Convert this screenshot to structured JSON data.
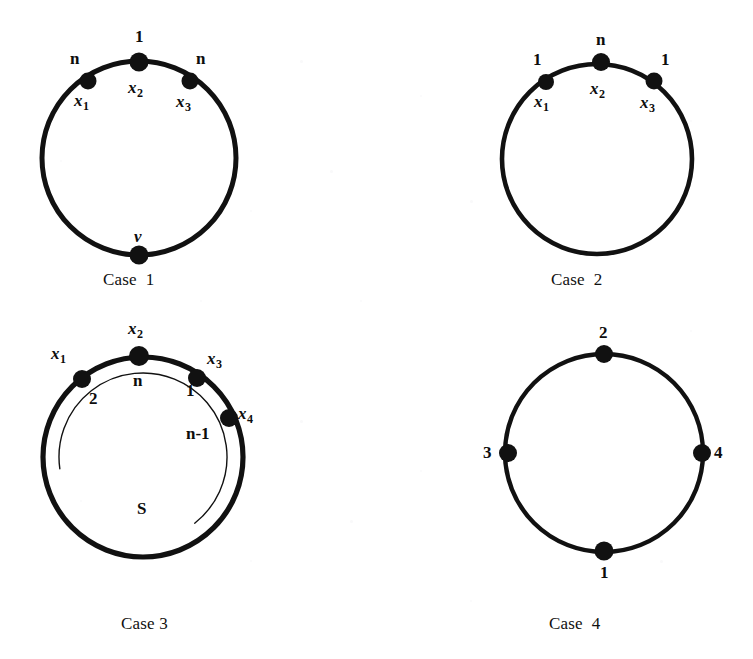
{
  "figure": {
    "background_color": "#ffffff",
    "ink_color": "#111111",
    "panels": [
      {
        "id": "case-1",
        "caption": "Case  1",
        "caption_pos": {
          "x": 103,
          "y": 270
        },
        "circle": {
          "cx": 139,
          "cy": 158,
          "r": 97,
          "stroke_width": 5.0
        },
        "inner_arc": null,
        "vertices": [
          {
            "name": "x1",
            "cx": 88,
            "cy": 81,
            "r": 8.5,
            "var_label": {
              "text": "x",
              "sub": "1",
              "x": 74,
              "y": 92
            },
            "edge_label": {
              "text": "n",
              "x": 70,
              "y": 50,
              "style": "plain"
            }
          },
          {
            "name": "x2",
            "cx": 139,
            "cy": 62,
            "r": 9.5,
            "var_label": {
              "text": "x",
              "sub": "2",
              "x": 128,
              "y": 79
            },
            "edge_label": {
              "text": "1",
              "x": 135,
              "y": 28,
              "style": "plain"
            }
          },
          {
            "name": "x3",
            "cx": 190,
            "cy": 81,
            "r": 8.5,
            "var_label": {
              "text": "x",
              "sub": "3",
              "x": 176,
              "y": 93
            },
            "edge_label": {
              "text": "n",
              "x": 196,
              "y": 50,
              "style": "plain"
            }
          },
          {
            "name": "v",
            "cx": 139,
            "cy": 255,
            "r": 9.5,
            "var_label": null,
            "edge_label": {
              "text": "v",
              "x": 134,
              "y": 228,
              "style": "italic"
            }
          }
        ]
      },
      {
        "id": "case-2",
        "caption": "Case  2",
        "caption_pos": {
          "x": 551,
          "y": 270
        },
        "circle": {
          "cx": 597,
          "cy": 159,
          "r": 95,
          "stroke_width": 4.6
        },
        "inner_arc": null,
        "vertices": [
          {
            "name": "x1",
            "cx": 546,
            "cy": 82,
            "r": 8.0,
            "var_label": {
              "text": "x",
              "sub": "1",
              "x": 534,
              "y": 93
            },
            "edge_label": {
              "text": "1",
              "x": 533,
              "y": 51,
              "style": "plain"
            }
          },
          {
            "name": "x2",
            "cx": 601,
            "cy": 62,
            "r": 9.0,
            "var_label": {
              "text": "x",
              "sub": "2",
              "x": 590,
              "y": 80
            },
            "edge_label": {
              "text": "n",
              "x": 596,
              "y": 31,
              "style": "plain"
            }
          },
          {
            "name": "x3",
            "cx": 654,
            "cy": 81,
            "r": 8.5,
            "var_label": {
              "text": "x",
              "sub": "3",
              "x": 640,
              "y": 94
            },
            "edge_label": {
              "text": "1",
              "x": 661,
              "y": 51,
              "style": "plain"
            }
          }
        ]
      },
      {
        "id": "case-3",
        "caption": "Case 3",
        "caption_pos": {
          "x": 121,
          "y": 614
        },
        "circle": {
          "cx": 143,
          "cy": 457,
          "r": 100,
          "stroke_width": 5.2
        },
        "inner_arc": {
          "label": "S",
          "label_pos": {
            "x": 137,
            "y": 500
          },
          "stroke_width": 1.4,
          "radius": 84,
          "start_angle_deg": 172,
          "end_angle_deg": 412
        },
        "vertices": [
          {
            "name": "x1",
            "cx": 82,
            "cy": 379,
            "r": 9.0,
            "var_label": {
              "text": "x",
              "sub": "1",
              "x": 51,
              "y": 345
            },
            "edge_label": {
              "text": "2",
              "x": 89,
              "y": 390,
              "style": "plain"
            }
          },
          {
            "name": "x2",
            "cx": 139,
            "cy": 356,
            "r": 10.0,
            "var_label": {
              "text": "x",
              "sub": "2",
              "x": 128,
              "y": 320
            },
            "edge_label": {
              "text": "n",
              "x": 133,
              "y": 372,
              "style": "plain"
            }
          },
          {
            "name": "x3",
            "cx": 197,
            "cy": 378,
            "r": 9.0,
            "var_label": {
              "text": "x",
              "sub": "3",
              "x": 207,
              "y": 350
            },
            "edge_label": {
              "text": "1",
              "x": 186,
              "y": 382,
              "style": "plain"
            }
          },
          {
            "name": "x4",
            "cx": 229,
            "cy": 418,
            "r": 9.0,
            "var_label": {
              "text": "x",
              "sub": "4",
              "x": 238,
              "y": 405
            },
            "edge_label": {
              "text": "n-1",
              "x": 186,
              "y": 425,
              "style": "plain"
            }
          }
        ]
      },
      {
        "id": "case-4",
        "caption": "Case  4",
        "caption_pos": {
          "x": 549,
          "y": 614
        },
        "circle": {
          "cx": 604,
          "cy": 453,
          "r": 99,
          "stroke_width": 4.4
        },
        "inner_arc": null,
        "vertices": [
          {
            "name": "top",
            "cx": 604,
            "cy": 354,
            "r": 9.0,
            "var_label": null,
            "edge_label": {
              "text": "2",
              "x": 599,
              "y": 324,
              "style": "plain"
            }
          },
          {
            "name": "left",
            "cx": 508,
            "cy": 453,
            "r": 9.0,
            "var_label": null,
            "edge_label": {
              "text": "3",
              "x": 483,
              "y": 444,
              "style": "plain"
            }
          },
          {
            "name": "right",
            "cx": 702,
            "cy": 453,
            "r": 9.0,
            "var_label": null,
            "edge_label": {
              "text": "4",
              "x": 714,
              "y": 444,
              "style": "plain"
            }
          },
          {
            "name": "bottom",
            "cx": 604,
            "cy": 551,
            "r": 9.5,
            "var_label": null,
            "edge_label": {
              "text": "1",
              "x": 600,
              "y": 564,
              "style": "plain"
            }
          }
        ]
      }
    ]
  }
}
